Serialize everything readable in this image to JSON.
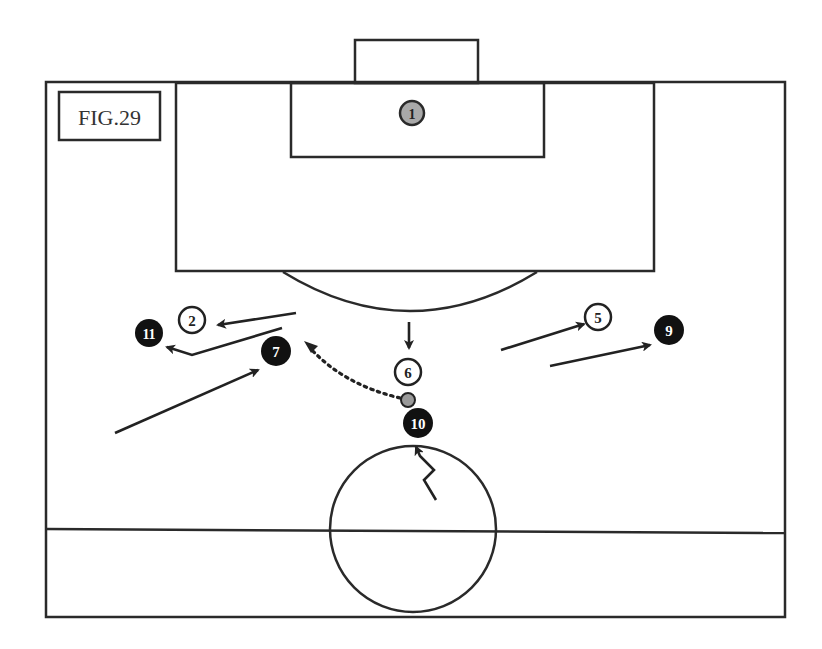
{
  "figure": {
    "label": "FIG.29"
  },
  "colors": {
    "line": "#2a2a2a",
    "attacker_fill": "#111111",
    "attacker_text": "#ffffff",
    "defender_fill": "#ffffff",
    "defender_text": "#222222",
    "goalkeeper_fill": "#a9a9a9",
    "goal_fill": "#cfcfcf",
    "ball_fill": "#9a9a9a"
  },
  "players": {
    "goalkeeper": {
      "number": "1",
      "team": "goalkeeper"
    },
    "p2": {
      "number": "2",
      "team": "defender"
    },
    "p5": {
      "number": "5",
      "team": "defender"
    },
    "p6": {
      "number": "6",
      "team": "defender"
    },
    "p7": {
      "number": "7",
      "team": "attacker"
    },
    "p9": {
      "number": "9",
      "team": "attacker"
    },
    "p10": {
      "number": "10",
      "team": "attacker"
    },
    "p11": {
      "number": "11",
      "team": "attacker"
    }
  },
  "movements": [
    {
      "id": "run-2",
      "type": "run",
      "description": "Defender 2 moves left"
    },
    {
      "id": "run-11",
      "type": "run",
      "description": "Attacker 11 runs left"
    },
    {
      "id": "run-7",
      "type": "run",
      "description": "Attacker 7 runs forward"
    },
    {
      "id": "run-6",
      "type": "run",
      "description": "Defender 6 steps up"
    },
    {
      "id": "pass-10-7",
      "type": "pass",
      "description": "Dotted pass from 10 toward space behind 7"
    },
    {
      "id": "dribble-10",
      "type": "dribble",
      "description": "Attacker 10 dribbles forward"
    },
    {
      "id": "run-5",
      "type": "run",
      "description": "Defender 5 moves right"
    },
    {
      "id": "run-9",
      "type": "run",
      "description": "Attacker 9 runs right"
    }
  ]
}
